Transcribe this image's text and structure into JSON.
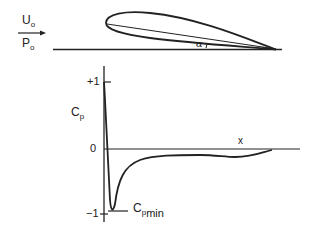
{
  "diagram": {
    "title": "",
    "airfoil": {
      "freestream_velocity": {
        "symbol": "U",
        "subscript": "o"
      },
      "freestream_pressure": {
        "symbol": "P",
        "subscript": "o"
      },
      "angle_of_attack": "α"
    },
    "pressure_plot": {
      "y_axis_label": {
        "symbol": "C",
        "subscript": "p"
      },
      "x_axis_label": "x",
      "y_ticks": [
        "+1",
        "0",
        "−1"
      ],
      "min_label": {
        "symbol": "C",
        "subscript": "p",
        "subsubscript": "min"
      }
    },
    "colors": {
      "ink": "#222222",
      "background": "#ffffff"
    }
  }
}
